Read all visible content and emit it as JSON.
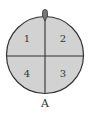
{
  "diagram": {
    "type": "spinner",
    "sectors": [
      {
        "position": "top-left",
        "label": "1"
      },
      {
        "position": "top-right",
        "label": "2"
      },
      {
        "position": "bottom-right",
        "label": "3"
      },
      {
        "position": "bottom-left",
        "label": "4"
      }
    ],
    "pointer_label": "A",
    "colors": {
      "fill": "#d2d2d2",
      "stroke": "#333333"
    }
  }
}
